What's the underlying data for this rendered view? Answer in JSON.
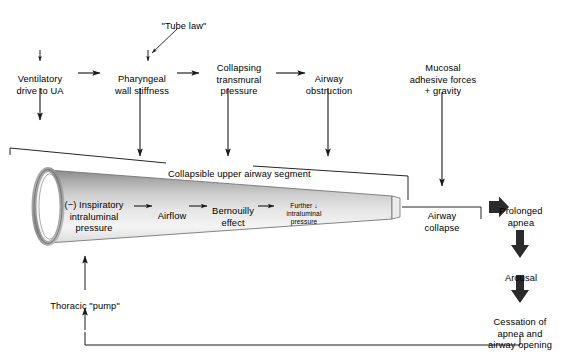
{
  "diagram": {
    "colors": {
      "stroke": "#1a1a1a",
      "text": "#000000",
      "background": "#ffffff",
      "tube_light": "#f2f2f2",
      "tube_mid": "#c9c9c9",
      "tube_dark": "#8f8f8f",
      "thick_arrow": "#2b2b2b"
    },
    "nodes": {
      "tube_law": "\"Tube law\"",
      "ventilatory_drive": "Ventilatory\ndrive to UA",
      "pharyngeal_stiffness": "Pharyngeal\nwall stiffness",
      "collapsing_pressure": "Collapsing\ntransmural\npressure",
      "airway_obstruction": "Airway\nobstruction",
      "mucosal_forces": "Mucosal\nadhesive forces\n+ gravity",
      "collapsible_segment": "Collapsible upper airway segment",
      "inspiratory_pressure": "(−) Inspiratory\nintraluminal\npressure",
      "airflow": "Airflow",
      "bernoulli": "Bernouilly\neffect",
      "further_pressure": "Further ↓\nintraluminal\npressure",
      "airway_collapse": "Airway\ncollapse",
      "prolonged_apnea": "Prolonged\napnea",
      "arousal": "Arousal",
      "cessation": "Cessation of\napnea and\nairway opening",
      "thoracic_pump": "Thoracic \"pump\""
    },
    "flow_chains": [
      [
        "Ventilatory drive to UA",
        "Pharyngeal wall stiffness",
        "Collapsing transmural pressure",
        "Airway obstruction"
      ],
      [
        "(−) Inspiratory intraluminal pressure",
        "Airflow",
        "Bernouilly effect",
        "Further ↓ intraluminal pressure"
      ],
      [
        "Airway collapse",
        "Prolonged apnea",
        "Arousal",
        "Cessation of apnea and airway opening"
      ]
    ]
  }
}
